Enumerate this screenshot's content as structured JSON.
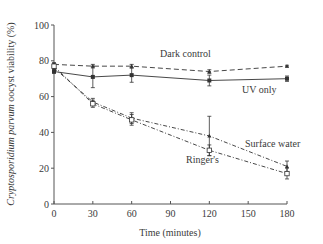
{
  "chart_data": {
    "type": "line",
    "title": "",
    "xlabel": "Time (minutes)",
    "ylabel_italic": "Cryptosporidium parvum",
    "ylabel_rest": " oocyst viability (%)",
    "ylabel": "Cryptosporidium parvum oocyst viability (%)",
    "x": [
      0,
      30,
      60,
      120,
      180
    ],
    "xlim": [
      0,
      180
    ],
    "ylim": [
      0,
      100
    ],
    "xticks": [
      0,
      30,
      60,
      90,
      120,
      150,
      180
    ],
    "yticks": [
      0,
      20,
      40,
      60,
      80,
      100
    ],
    "grid": false,
    "legend_position": "inline labels",
    "series": [
      {
        "name": "Dark control",
        "values": [
          78,
          77,
          77,
          74,
          77
        ],
        "errors": [
          1,
          1,
          1,
          1,
          0.5
        ],
        "line_style": "dashed",
        "marker": "filled-triangle",
        "label_pos": [
          160,
          57
        ]
      },
      {
        "name": "UV only",
        "values": [
          74,
          71,
          72,
          69,
          70
        ],
        "errors": [
          1,
          6,
          4,
          3,
          1.5
        ],
        "line_style": "solid",
        "marker": "filled-square",
        "label_pos": [
          242,
          93
        ]
      },
      {
        "name": "Surface water",
        "values": [
          76,
          57,
          48,
          38,
          21
        ],
        "errors": [
          2,
          2,
          3,
          11,
          3
        ],
        "line_style": "dash-dot",
        "marker": "filled-triangle",
        "label_pos": [
          245,
          147
        ]
      },
      {
        "name": "Ringer's",
        "values": [
          77,
          56,
          47,
          30,
          17
        ],
        "errors": [
          1.5,
          2,
          3,
          3,
          3
        ],
        "line_style": "dash-dot",
        "marker": "open-square",
        "label_pos": [
          186,
          163
        ]
      }
    ]
  },
  "colors": {
    "axis": "#555555",
    "line": "#333333",
    "text": "#3a3a3a"
  }
}
